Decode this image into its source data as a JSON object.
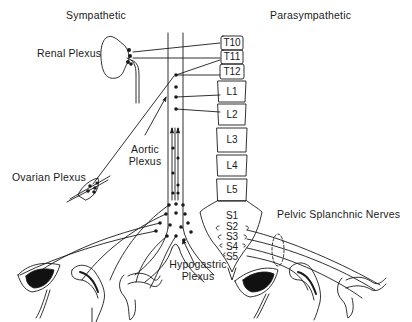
{
  "diagram": {
    "headings": {
      "sympathetic": "Sympathetic",
      "parasympathetic": "Parasympathetic"
    },
    "labels": {
      "renal_plexus": "Renal Plexus",
      "aortic_plexus_line1": "Aortic",
      "aortic_plexus_line2": "Plexus",
      "ovarian_plexus": "Ovarian Plexus",
      "hypogastric_plexus_line1": "Hypogastric",
      "hypogastric_plexus_line2": "Plexus",
      "pelvic_splanchnic_nerves": "Pelvic Splanchnic Nerves"
    },
    "vertebrae": {
      "thoracic": [
        "T10",
        "T11",
        "T12"
      ],
      "lumbar": [
        "L1",
        "L2",
        "L3",
        "L4",
        "L5"
      ],
      "sacral": [
        "S1",
        "S2",
        "S3",
        "S4",
        "S5"
      ]
    },
    "colors": {
      "ink": "#1a1a1a",
      "background": "#ffffff"
    }
  }
}
